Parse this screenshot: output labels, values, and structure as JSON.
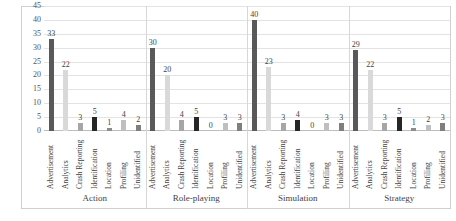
{
  "chart_data": {
    "type": "bar",
    "title": "",
    "subtitle": "",
    "xlabel": "",
    "ylabel": "",
    "ylim": [
      0,
      45
    ],
    "yticks": [
      0,
      5,
      10,
      15,
      20,
      25,
      30,
      35,
      40,
      45
    ],
    "grid": true,
    "legend": "none",
    "categories": [
      "Advertisement",
      "Analytics",
      "Crash Reporting",
      "Identification",
      "Location",
      "Profiling",
      "Unidentified"
    ],
    "groups": [
      {
        "name": "Action",
        "values": [
          33,
          22,
          3,
          5,
          1,
          4,
          2
        ]
      },
      {
        "name": "Role-playing",
        "values": [
          30,
          20,
          4,
          5,
          0,
          3,
          3
        ]
      },
      {
        "name": "Simulation",
        "values": [
          40,
          23,
          3,
          4,
          0,
          3,
          3
        ]
      },
      {
        "name": "Strategy",
        "values": [
          29,
          22,
          3,
          5,
          1,
          2,
          3
        ]
      }
    ],
    "bar_colors": [
      "#595959",
      "#d9d9d9",
      "#a6a6a6",
      "#262626",
      "#8c8c8c",
      "#bfbfbf",
      "#7f7f7f"
    ],
    "colors": {
      "gridline": "#e3e3e3",
      "axis": "#bdbdbd",
      "frame": "#d0d0d0",
      "text": "#3f3f3f",
      "background": "#ffffff"
    }
  }
}
